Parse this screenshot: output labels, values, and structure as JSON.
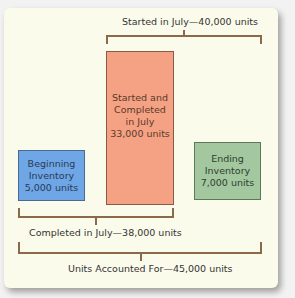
{
  "diagram": {
    "top_bracket_label": "Started in July—40,000 units",
    "middle_bracket_label": "Completed in July—38,000 units",
    "bottom_bracket_label": "Units Accounted For—45,000 units",
    "boxes": [
      {
        "id": "beginning-inventory",
        "lines": [
          "Beginning",
          "Inventory",
          "5,000 units"
        ],
        "color": "#6ea6e6"
      },
      {
        "id": "started-and-completed",
        "lines": [
          "Started and",
          "Completed",
          "in July",
          "33,000 units"
        ],
        "color": "#f4a283"
      },
      {
        "id": "ending-inventory",
        "lines": [
          "Ending",
          "Inventory",
          "7,000 units"
        ],
        "color": "#a3c8a0"
      }
    ],
    "bracket_color": "#8a6a4a",
    "background_color": "#fbfbec"
  }
}
